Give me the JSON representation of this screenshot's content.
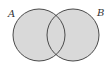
{
  "diagram": {
    "type": "venn",
    "sets": [
      {
        "label": "A"
      },
      {
        "label": "B"
      }
    ],
    "shaded_region": "A ∪ B",
    "colors": {
      "fill": "#d9d9d9",
      "stroke": "#4a4a4a",
      "background": "#ffffff"
    }
  }
}
